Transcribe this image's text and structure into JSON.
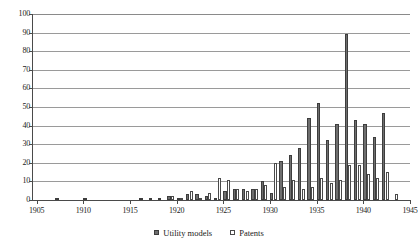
{
  "chart_data": {
    "type": "bar",
    "title": "",
    "subtitle": "",
    "xlabel": "",
    "ylabel": "",
    "xlim": [
      1904.5,
      1945.0
    ],
    "ylim": [
      0,
      100
    ],
    "ytick_step": 10,
    "yticks": [
      0,
      10,
      20,
      30,
      40,
      50,
      60,
      70,
      80,
      90,
      100
    ],
    "xticks": [
      1905,
      1910,
      1915,
      1920,
      1925,
      1930,
      1935,
      1940,
      1945
    ],
    "xtick_labels": [
      "1905",
      "1910",
      "1915",
      "1920",
      "1925",
      "1930",
      "1935",
      "1940",
      "1945"
    ],
    "ytick_labels": [
      "0",
      "10",
      "20",
      "30",
      "40",
      "50",
      "60",
      "70",
      "80",
      "90",
      "100"
    ],
    "grid": true,
    "grid_axis": "y",
    "legend_position": "bottom",
    "bar_grouping": "grouped",
    "categories": [
      1905,
      1906,
      1907,
      1908,
      1909,
      1910,
      1911,
      1912,
      1913,
      1914,
      1915,
      1916,
      1917,
      1918,
      1919,
      1920,
      1921,
      1922,
      1923,
      1924,
      1925,
      1926,
      1927,
      1928,
      1929,
      1930,
      1931,
      1932,
      1933,
      1934,
      1935,
      1936,
      1937,
      1938,
      1939,
      1940,
      1941,
      1942,
      1943,
      1944
    ],
    "series": [
      {
        "name": "Utility models",
        "color": "#6e6e6e",
        "values": [
          0,
          0,
          1,
          0,
          0,
          1,
          0,
          0,
          0,
          0,
          0,
          1,
          1,
          1,
          2,
          1,
          3,
          3,
          2,
          1,
          5,
          6,
          6,
          6,
          10,
          4,
          21,
          24,
          28,
          44,
          52,
          32,
          41,
          89,
          43,
          41,
          34,
          47,
          0,
          0
        ]
      },
      {
        "name": "Patents",
        "color": "#ffffff",
        "values": [
          0,
          0,
          0,
          0,
          0,
          0,
          0,
          0,
          0,
          0,
          0,
          0,
          0,
          0,
          2,
          1,
          5,
          1,
          4,
          12,
          11,
          6,
          5,
          6,
          8,
          20,
          7,
          11,
          6,
          7,
          12,
          9,
          11,
          19,
          19,
          14,
          12,
          15,
          3,
          0
        ]
      }
    ],
    "peak": {
      "year": 1938,
      "series": "Utility models",
      "value": 89
    },
    "axis_color": "#4a4a4a",
    "grid_color": "#9a9a9a"
  },
  "legend": {
    "items": [
      {
        "label": "Utility models",
        "swatch": "filled-square-dark"
      },
      {
        "label": "Patents",
        "swatch": "open-square-white"
      }
    ]
  }
}
